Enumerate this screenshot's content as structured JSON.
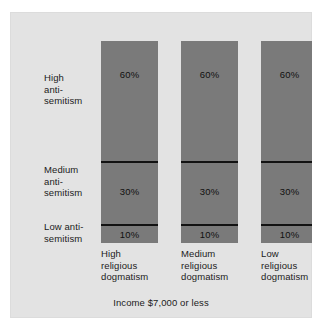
{
  "chart_data": {
    "type": "bar",
    "title": "",
    "subtitle": "",
    "caption": "Income $7,000 or less",
    "xlabel": "",
    "ylabel": "",
    "ylim": [
      0,
      100
    ],
    "grid": false,
    "legend_position": "left-axis-labels",
    "stacked": true,
    "orientation": "vertical",
    "categories": [
      "High\nreligious\ndogmatism",
      "Medium\nreligious\ndogmatism",
      "Low\nreligious\ndogmatism"
    ],
    "row_labels": [
      "High\nanti-\nsemitism",
      "Medium\nanti-\nsemitism",
      "Low anti-\nsemitism"
    ],
    "series": [
      {
        "name": "High anti-semitism",
        "values": [
          60,
          60,
          60
        ],
        "labels": [
          "60%",
          "60%",
          "60%"
        ]
      },
      {
        "name": "Medium anti-semitism",
        "values": [
          30,
          30,
          30
        ],
        "labels": [
          "30%",
          "30%",
          "30%"
        ]
      },
      {
        "name": "Low anti-semitism",
        "values": [
          10,
          10,
          10
        ],
        "labels": [
          "10%",
          "10%",
          "10%"
        ]
      }
    ],
    "colors": {
      "panel_background": "#e3e3e3",
      "bar_fill": "#7a7a7a",
      "divider": "#121212",
      "text": "#1b1b1b"
    }
  }
}
